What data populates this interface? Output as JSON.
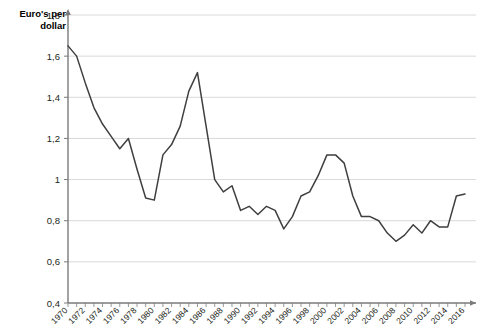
{
  "chart_data": {
    "type": "line",
    "title": "",
    "ylabel": "Euro's per dollar",
    "xlabel": "",
    "ylim": [
      0.4,
      1.8
    ],
    "ytick_values": [
      0.4,
      0.6,
      0.8,
      1.0,
      1.2,
      1.4,
      1.6,
      1.8
    ],
    "ytick_labels": [
      "0,4",
      "0,6",
      "0,8",
      "1",
      "1,2",
      "1,4",
      "1,6",
      "1,8"
    ],
    "xlim": [
      1970,
      2016
    ],
    "xtick_labels": [
      "1970",
      "1972",
      "1974",
      "1976",
      "1978",
      "1980",
      "1982",
      "1984",
      "1986",
      "1988",
      "1990",
      "1992",
      "1994",
      "1996",
      "1998",
      "2000",
      "2002",
      "2004",
      "2006",
      "2008",
      "2010",
      "2012",
      "2014",
      "2016"
    ],
    "grid": true,
    "legend": false,
    "series": [
      {
        "name": "Euro's per dollar",
        "x": [
          1970,
          1971,
          1972,
          1973,
          1974,
          1975,
          1976,
          1977,
          1978,
          1979,
          1980,
          1981,
          1982,
          1983,
          1984,
          1985,
          1986,
          1987,
          1988,
          1989,
          1990,
          1991,
          1992,
          1993,
          1994,
          1995,
          1996,
          1997,
          1998,
          1999,
          2000,
          2001,
          2002,
          2003,
          2004,
          2005,
          2006,
          2007,
          2008,
          2009,
          2010,
          2011,
          2012,
          2013,
          2014,
          2015,
          2016
        ],
        "values": [
          1.65,
          1.6,
          1.47,
          1.35,
          1.27,
          1.21,
          1.15,
          1.2,
          1.05,
          0.91,
          0.9,
          1.12,
          1.17,
          1.26,
          1.43,
          1.52,
          1.26,
          1.0,
          0.94,
          0.97,
          0.85,
          0.87,
          0.83,
          0.87,
          0.85,
          0.76,
          0.82,
          0.92,
          0.94,
          1.02,
          1.12,
          1.12,
          1.08,
          0.92,
          0.82,
          0.82,
          0.8,
          0.74,
          0.7,
          0.73,
          0.78,
          0.74,
          0.8,
          0.77,
          0.77,
          0.92,
          0.93
        ]
      }
    ]
  }
}
